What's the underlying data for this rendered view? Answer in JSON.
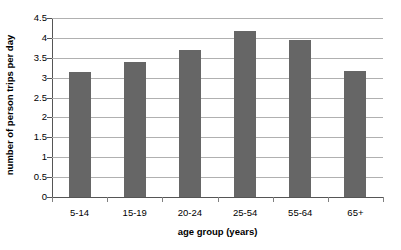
{
  "chart_data": {
    "type": "bar",
    "title": "",
    "xlabel": "age group (years)",
    "ylabel": "number of person trips per day",
    "categories": [
      "5-14",
      "15-19",
      "20-24",
      "25-54",
      "55-64",
      "65+"
    ],
    "values": [
      3.15,
      3.4,
      3.7,
      4.18,
      3.95,
      3.17
    ],
    "ylim": [
      0,
      4.5
    ],
    "yticks": [
      0,
      0.5,
      1,
      1.5,
      2,
      2.5,
      3,
      3.5,
      4,
      4.5
    ],
    "ytick_labels": [
      "0",
      "0.5",
      "1",
      "1.5",
      "2",
      "2.5",
      "3",
      "3.5",
      "4",
      "4.5"
    ],
    "grid": true,
    "legend": false,
    "legend_position": "none",
    "series": [
      {
        "name": "person trips per day",
        "color": "#666666",
        "values": [
          3.15,
          3.4,
          3.7,
          4.18,
          3.95,
          3.17
        ]
      }
    ]
  },
  "style": {
    "bar_color": "#666666",
    "grid_color": "#b0b0b0",
    "axis_color": "#555555",
    "background": "#ffffff"
  }
}
